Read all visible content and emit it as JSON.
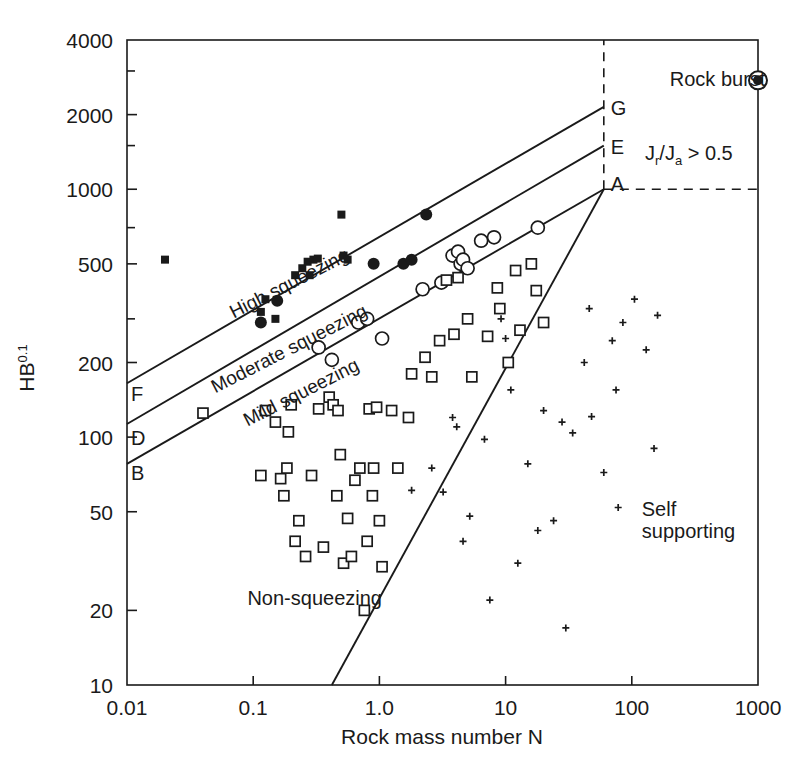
{
  "chart_data": {
    "type": "scatter",
    "title": "",
    "xlabel": "Rock mass number N",
    "ylabel": "HB",
    "ylabel_exponent": "0.1",
    "xscale": "log",
    "yscale": "log",
    "xlim": [
      0.01,
      1000
    ],
    "ylim": [
      10,
      4000
    ],
    "grid": false,
    "legend": "none",
    "xticks": [
      "0.01",
      "0.1",
      "1.0",
      "10",
      "100",
      "1000"
    ],
    "xtick_values": [
      0.01,
      0.1,
      1.0,
      10,
      100,
      1000
    ],
    "yticks": [
      "10",
      "20",
      "50",
      "100",
      "200",
      "500",
      "1000",
      "2000",
      "4000"
    ],
    "ytick_values": [
      10,
      20,
      50,
      100,
      200,
      500,
      1000,
      2000,
      4000
    ],
    "annotations": [
      {
        "name": "high-squeezing",
        "text": "High squeezing",
        "x": 0.07,
        "y": 300,
        "rotation": -27
      },
      {
        "name": "moderate-squeezing",
        "text": "Moderate squeezing",
        "x": 0.05,
        "y": 150,
        "rotation": -27
      },
      {
        "name": "mild-squeezing",
        "text": "Mild squeezing",
        "x": 0.09,
        "y": 110,
        "rotation": -27
      },
      {
        "name": "non-squeezing",
        "text": "Non-squeezing",
        "x": 0.09,
        "y": 21,
        "rotation": 0
      },
      {
        "name": "self-supporting-line1",
        "text": "Self",
        "x": 120,
        "y": 48,
        "rotation": 0
      },
      {
        "name": "self-supporting-line2",
        "text": "supporting",
        "x": 120,
        "y": 39,
        "rotation": 0
      },
      {
        "name": "rock-burst",
        "text": "Rock burst",
        "x": 200,
        "y": 2600,
        "rotation": 0
      },
      {
        "name": "jr-ja-condition",
        "text": "J",
        "text_full": "Jr/Ja > 0.5",
        "x": 80,
        "y": 1500,
        "rotation": 0
      }
    ],
    "node_labels": [
      {
        "name": "node-G",
        "label": "G",
        "x": 60,
        "y": 2150
      },
      {
        "name": "node-E",
        "label": "E",
        "x": 60,
        "y": 1500
      },
      {
        "name": "node-A",
        "label": "A",
        "x": 60,
        "y": 1000
      },
      {
        "name": "node-F",
        "label": "F",
        "x": 0.01,
        "y": 150
      },
      {
        "name": "node-D",
        "label": "D",
        "x": 0.01,
        "y": 100
      },
      {
        "name": "node-B",
        "label": "B",
        "x": 0.01,
        "y": 72
      }
    ],
    "boundary_lines": [
      {
        "name": "line-F-G",
        "from_label": "F",
        "to_label": "G",
        "from": [
          0.01,
          165
        ],
        "to": [
          60,
          2150
        ]
      },
      {
        "name": "line-D-E",
        "from_label": "D",
        "to_label": "E",
        "from": [
          0.01,
          113
        ],
        "to": [
          60,
          1500
        ]
      },
      {
        "name": "line-B-A",
        "from_label": "B",
        "to_label": "A",
        "from": [
          0.01,
          78
        ],
        "to": [
          60,
          1000
        ]
      },
      {
        "name": "line-self-supporting",
        "from_label": "A",
        "to_label": "",
        "from": [
          60,
          1000
        ],
        "to": [
          0.42,
          10
        ]
      }
    ],
    "dashed_lines": [
      {
        "name": "dashed-vertical-N60",
        "orientation": "vertical",
        "x": 60,
        "y_from": 1000,
        "y_to": 4000
      },
      {
        "name": "dashed-horizontal-HB1000",
        "orientation": "horizontal",
        "y": 1000,
        "x_from": 60,
        "x_to": 1000
      }
    ],
    "series": [
      {
        "name": "High squeezing (filled squares)",
        "marker": "filled-square",
        "points": [
          [
            0.02,
            520
          ],
          [
            0.115,
            320
          ],
          [
            0.125,
            360
          ],
          [
            0.15,
            300
          ],
          [
            0.215,
            450
          ],
          [
            0.245,
            480
          ],
          [
            0.27,
            510
          ],
          [
            0.28,
            450
          ],
          [
            0.3,
            520
          ],
          [
            0.325,
            525
          ],
          [
            0.5,
            790
          ],
          [
            0.52,
            540
          ],
          [
            0.56,
            520
          ]
        ]
      },
      {
        "name": "High/moderate squeezing (filled circles)",
        "marker": "filled-circle",
        "points": [
          [
            0.115,
            290
          ],
          [
            0.155,
            355
          ],
          [
            0.9,
            500
          ],
          [
            1.55,
            500
          ],
          [
            1.8,
            520
          ],
          [
            2.35,
            790
          ]
        ]
      },
      {
        "name": "Moderate / mild squeezing (open circles)",
        "marker": "open-circle",
        "points": [
          [
            0.33,
            230
          ],
          [
            0.42,
            205
          ],
          [
            0.68,
            290
          ],
          [
            0.8,
            300
          ],
          [
            1.05,
            250
          ],
          [
            2.2,
            395
          ],
          [
            3.1,
            420
          ],
          [
            3.8,
            540
          ],
          [
            4.2,
            560
          ],
          [
            4.4,
            500
          ],
          [
            4.6,
            520
          ],
          [
            5.0,
            480
          ],
          [
            6.4,
            620
          ],
          [
            8.1,
            640
          ],
          [
            18.0,
            700
          ]
        ]
      },
      {
        "name": "Non-squeezing (open squares)",
        "marker": "open-square",
        "points": [
          [
            0.04,
            125
          ],
          [
            0.115,
            70
          ],
          [
            0.125,
            128
          ],
          [
            0.15,
            115
          ],
          [
            0.165,
            68
          ],
          [
            0.175,
            58
          ],
          [
            0.185,
            75
          ],
          [
            0.19,
            105
          ],
          [
            0.2,
            135
          ],
          [
            0.215,
            38
          ],
          [
            0.23,
            46
          ],
          [
            0.26,
            33
          ],
          [
            0.29,
            70
          ],
          [
            0.33,
            130
          ],
          [
            0.36,
            36
          ],
          [
            0.4,
            145
          ],
          [
            0.43,
            135
          ],
          [
            0.46,
            58
          ],
          [
            0.47,
            128
          ],
          [
            0.49,
            85
          ],
          [
            0.52,
            31
          ],
          [
            0.56,
            47
          ],
          [
            0.6,
            33
          ],
          [
            0.64,
            67
          ],
          [
            0.7,
            75
          ],
          [
            0.76,
            20
          ],
          [
            0.8,
            38
          ],
          [
            0.83,
            130
          ],
          [
            0.88,
            58
          ],
          [
            0.9,
            75
          ],
          [
            0.95,
            132
          ],
          [
            1.0,
            46
          ],
          [
            1.05,
            30
          ],
          [
            1.25,
            128
          ],
          [
            1.4,
            75
          ],
          [
            1.7,
            120
          ],
          [
            1.8,
            180
          ],
          [
            2.3,
            210
          ],
          [
            2.6,
            175
          ],
          [
            3.0,
            245
          ],
          [
            3.4,
            430
          ],
          [
            3.9,
            260
          ],
          [
            4.2,
            440
          ],
          [
            5.0,
            300
          ],
          [
            5.4,
            175
          ],
          [
            7.2,
            255
          ],
          [
            8.6,
            400
          ],
          [
            9.0,
            330
          ],
          [
            10.5,
            200
          ],
          [
            12.0,
            470
          ],
          [
            13.0,
            270
          ],
          [
            16.0,
            500
          ],
          [
            17.5,
            390
          ],
          [
            20.0,
            290
          ]
        ]
      },
      {
        "name": "Self supporting (plus markers)",
        "marker": "plus",
        "points": [
          [
            1.8,
            61
          ],
          [
            2.6,
            75
          ],
          [
            3.2,
            60
          ],
          [
            3.8,
            120
          ],
          [
            4.1,
            110
          ],
          [
            4.6,
            38
          ],
          [
            5.2,
            48
          ],
          [
            6.8,
            98
          ],
          [
            7.5,
            22
          ],
          [
            9.2,
            300
          ],
          [
            10.0,
            250
          ],
          [
            11.0,
            155
          ],
          [
            12.5,
            31
          ],
          [
            15.0,
            78
          ],
          [
            18.0,
            42
          ],
          [
            20.0,
            128
          ],
          [
            24.0,
            46
          ],
          [
            28.0,
            115
          ],
          [
            30.0,
            17
          ],
          [
            34.0,
            104
          ],
          [
            42.0,
            200
          ],
          [
            46.0,
            330
          ],
          [
            48.0,
            121
          ],
          [
            60.0,
            72
          ],
          [
            70.0,
            245
          ],
          [
            75.0,
            155
          ],
          [
            78.0,
            52
          ],
          [
            85.0,
            290
          ],
          [
            105.0,
            360
          ],
          [
            130.0,
            225
          ],
          [
            150.0,
            90
          ],
          [
            160.0,
            310
          ]
        ]
      },
      {
        "name": "Rock burst (bullseye circle)",
        "marker": "bullseye",
        "points": [
          [
            1000,
            2750
          ]
        ]
      }
    ]
  }
}
